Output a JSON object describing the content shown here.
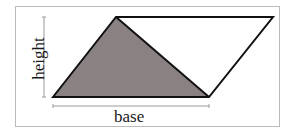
{
  "diagram": {
    "type": "parallelogram-area",
    "labels": {
      "height": "height",
      "base": "base"
    },
    "colors": {
      "shaded_triangle": "#8a8282",
      "outline": "#111111",
      "dimension_line": "#9a9a9a",
      "frame_border": "#bcbcbc"
    },
    "shapes": [
      {
        "name": "parallelogram",
        "points": [
          [
            53,
            97
          ],
          [
            116,
            17
          ],
          [
            273,
            17
          ],
          [
            209,
            97
          ]
        ],
        "fill": "none"
      },
      {
        "name": "shaded-triangle",
        "points": [
          [
            53,
            97
          ],
          [
            116,
            17
          ],
          [
            209,
            97
          ]
        ],
        "fill": "#8a8282"
      }
    ]
  }
}
